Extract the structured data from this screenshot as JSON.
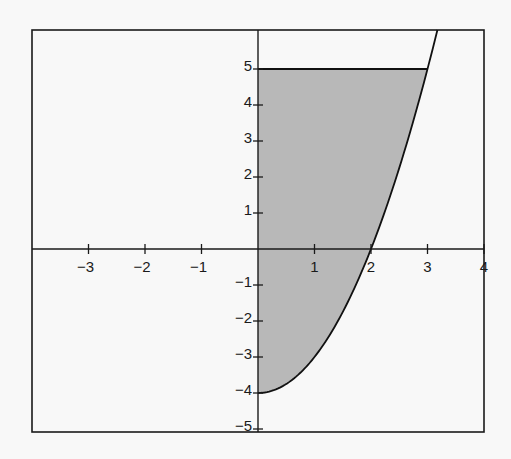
{
  "chart_data": {
    "type": "area",
    "title": "",
    "xlabel": "",
    "ylabel": "",
    "xlim": [
      -4.0,
      4.0
    ],
    "ylim": [
      -5.1,
      6.1
    ],
    "grid": false,
    "legend": null,
    "x_ticks": [
      -3,
      -2,
      -1,
      1,
      2,
      3,
      4
    ],
    "x_tick_labels": [
      "−3",
      "−2",
      "−1",
      "1",
      "2",
      "3",
      "4"
    ],
    "y_ticks": [
      5,
      4,
      3,
      2,
      1,
      -1,
      -2,
      -3,
      -4,
      -5
    ],
    "y_tick_labels": [
      "5",
      "4",
      "3",
      "2",
      "1",
      "−1",
      "−2",
      "−3",
      "−4",
      "−5"
    ],
    "series": [
      {
        "name": "curve",
        "kind": "line",
        "equation": "y = x^2 - 4",
        "x": [
          0,
          0.5,
          1,
          1.5,
          2,
          2.5,
          3,
          3.17
        ],
        "y": [
          -4,
          -3.75,
          -3,
          -1.75,
          0,
          2.25,
          5,
          6.05
        ]
      },
      {
        "name": "horizontal-line",
        "kind": "line",
        "equation": "y = 5",
        "x": [
          0,
          3
        ],
        "y": [
          5,
          5
        ]
      }
    ],
    "shaded_region": {
      "description": "Region bounded by x = 0, y = 5, and y = x^2 - 4",
      "x_range": [
        0,
        3
      ],
      "lower": "y = x^2 - 4",
      "upper": "y = 5",
      "color": "#b8b8b8"
    }
  },
  "colors": {
    "background": "#f8f8f8",
    "axis": "#1a1a1a",
    "shade": "#b8b8b8"
  }
}
